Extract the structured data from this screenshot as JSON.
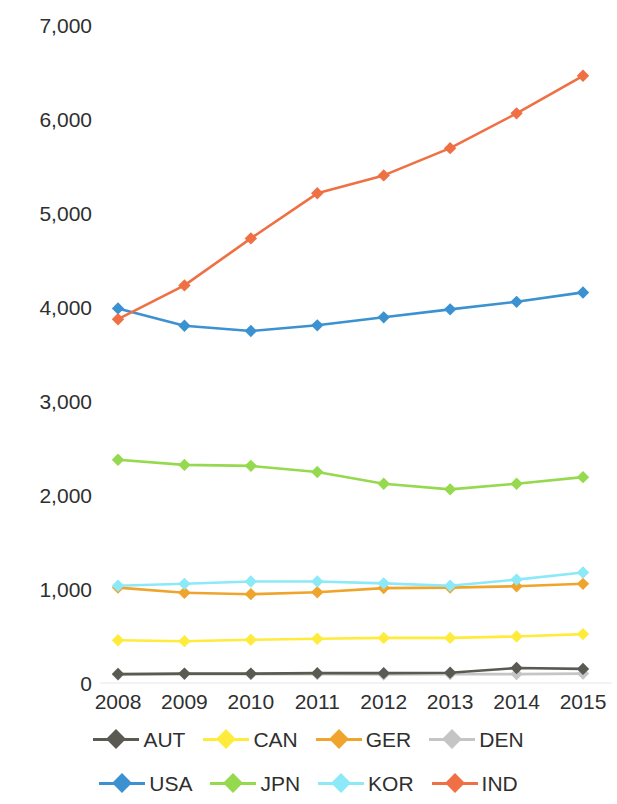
{
  "chart_data": {
    "type": "line",
    "title": "",
    "xlabel": "",
    "ylabel": "",
    "categories": [
      "2008",
      "2009",
      "2010",
      "2011",
      "2012",
      "2013",
      "2014",
      "2015"
    ],
    "x_tick_labels": [
      "2008",
      "2009",
      "2010",
      "2011",
      "2012",
      "2013",
      "2014",
      "2015"
    ],
    "y_tick_labels": [
      "7,000",
      "6,000",
      "5,000",
      "4,000",
      "3,000",
      "2,000",
      "1,000",
      "0"
    ],
    "y_ticks": [
      7000,
      6000,
      5000,
      4000,
      3000,
      2000,
      1000,
      0
    ],
    "ylim": [
      0,
      7000
    ],
    "grid": false,
    "legend_position": "bottom",
    "legend_entries": [
      "AUT",
      "CAN",
      "GER",
      "DEN",
      "USA",
      "JPN",
      "KOR",
      "IND"
    ],
    "series": [
      {
        "name": "AUT",
        "color": "#5a5a52",
        "values": [
          95,
          100,
          100,
          105,
          105,
          110,
          160,
          150
        ]
      },
      {
        "name": "CAN",
        "color": "#ffeb3c",
        "values": [
          455,
          445,
          460,
          470,
          480,
          480,
          495,
          520
        ]
      },
      {
        "name": "GER",
        "color": "#efa42c",
        "values": [
          1015,
          960,
          945,
          965,
          1010,
          1015,
          1030,
          1055
        ]
      },
      {
        "name": "DEN",
        "color": "#c5c5c5",
        "values": [
          90,
          95,
          95,
          95,
          90,
          95,
          95,
          100
        ]
      },
      {
        "name": "USA",
        "color": "#3c92d0",
        "values": [
          3985,
          3800,
          3745,
          3805,
          3890,
          3975,
          4055,
          4155
        ]
      },
      {
        "name": "JPN",
        "color": "#95d94e",
        "values": [
          2375,
          2320,
          2310,
          2245,
          2120,
          2060,
          2120,
          2190
        ]
      },
      {
        "name": "KOR",
        "color": "#8ce9f7",
        "values": [
          1035,
          1055,
          1080,
          1080,
          1060,
          1035,
          1100,
          1175
        ]
      },
      {
        "name": "IND",
        "color": "#ee7044",
        "values": [
          3870,
          4230,
          4730,
          5210,
          5400,
          5690,
          6060,
          6460
        ]
      }
    ]
  }
}
